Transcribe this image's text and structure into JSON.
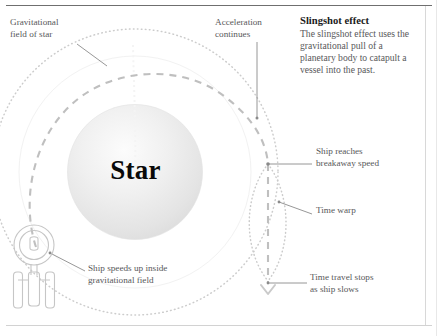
{
  "figure": {
    "star_label": "Star",
    "panel": {
      "title": "Slingshot effect",
      "body": "The slingshot effect uses the gravitational pull of a planetary body to catapult a vessel into the past."
    },
    "annotations": {
      "gravitational_field": "Gravitational\nfield of star",
      "acceleration": "Acceleration\ncontinues",
      "breakaway": "Ship reaches\nbreakaway speed",
      "time_warp": "Time warp",
      "time_stops": "Time travel stops\nas ship slows",
      "ship_speeds_up": "Ship speeds up inside\ngravitational field"
    },
    "colors": {
      "text_body": "#58585a",
      "text_title": "#1b1b1b",
      "star_fill_outer": "#e3e3e3",
      "star_fill_inner": "#fbfbfb",
      "field_dotted": "#c9c9c9",
      "trajectory_dashed": "#bdbdbd",
      "leader_line": "#7d7d7d",
      "ship_outline": "#c4c4c4",
      "rule_top": "#6f6f6f",
      "rule_border": "#d8d8d8"
    },
    "icons": {
      "ship": "starship-icon",
      "arrow": "arrow-down-chevron-icon"
    }
  }
}
